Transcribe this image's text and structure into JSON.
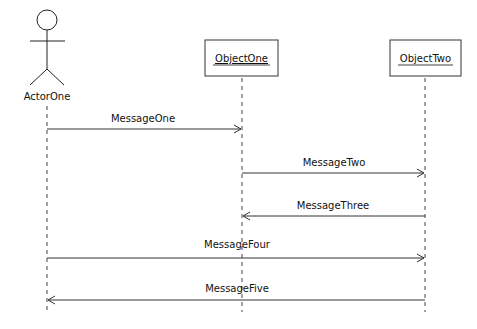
{
  "diagram": {
    "type": "sequence",
    "actor": {
      "label": "ActorOne"
    },
    "objects": [
      {
        "label": "ObjectOne"
      },
      {
        "label": "ObjectTwo"
      }
    ],
    "messages": [
      {
        "label": "MessageOne",
        "from": "ActorOne",
        "to": "ObjectOne"
      },
      {
        "label": "MessageTwo",
        "from": "ObjectOne",
        "to": "ObjectTwo"
      },
      {
        "label": "MessageThree",
        "from": "ObjectTwo",
        "to": "ObjectOne"
      },
      {
        "label": "MessageFour",
        "from": "ActorOne",
        "to": "ObjectTwo"
      },
      {
        "label": "MessageFive",
        "from": "ObjectTwo",
        "to": "ActorOne"
      }
    ]
  }
}
